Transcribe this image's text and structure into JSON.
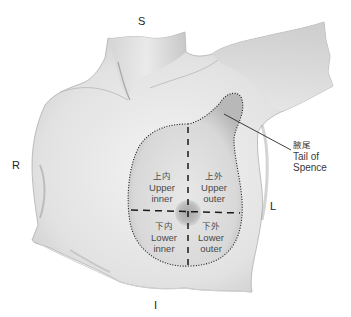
{
  "figure": {
    "orientation": {
      "superior": "S",
      "inferior": "I",
      "right": "R",
      "left": "L"
    },
    "quadrants": [
      {
        "cn": "上内",
        "en_line1": "Upper",
        "en_line2": "inner"
      },
      {
        "cn": "上外",
        "en_line1": "Upper",
        "en_line2": "outer"
      },
      {
        "cn": "下内",
        "en_line1": "Lower",
        "en_line2": "inner"
      },
      {
        "cn": "下外",
        "en_line1": "Lower",
        "en_line2": "outer"
      }
    ],
    "tail_label": {
      "cn": "腋尾",
      "en_line1": "Tail of",
      "en_line2": "Spence"
    },
    "colors": {
      "background": "#ffffff",
      "skin_light": "#e9e9e9",
      "skin_mid": "#cfcfcf",
      "skin_shadow": "#a9a9a9",
      "outline": "#1a1a1a",
      "areola": "#b5b5b5",
      "text": "#2a2a2a"
    }
  }
}
